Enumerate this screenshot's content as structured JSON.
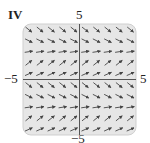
{
  "panel": {
    "id_label": "IV",
    "axis_labels": {
      "top": "5",
      "left": "−5",
      "right": "5",
      "bottom": "−5"
    }
  },
  "colors": {
    "background": "#ffffff",
    "panel_fill": "#e6e6e6",
    "panel_border": "#cfcfcf",
    "axis": "#555555",
    "arrow": "#444444"
  },
  "chart_data": {
    "type": "direction_field",
    "title": "IV",
    "xlim": [
      -5,
      5
    ],
    "ylim": [
      -5,
      5
    ],
    "grid": {
      "cols": 10,
      "rows": 10
    },
    "row_slopes_top_to_bottom": [
      -0.8,
      -0.5,
      0.15,
      0.8,
      0.45,
      -0.8,
      -0.5,
      0.15,
      0.8,
      0.45
    ]
  }
}
